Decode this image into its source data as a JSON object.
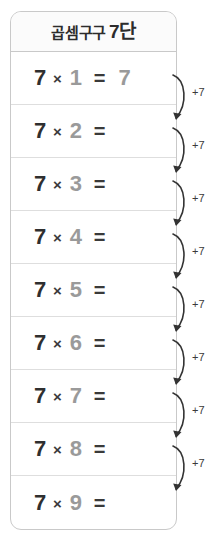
{
  "worksheet": {
    "title_prefix": "곱셈구구",
    "title_dan": "7단",
    "title_full": "곱셈구구 7단",
    "times_symbol": "×",
    "equals_symbol": "=",
    "multiplicand": "7",
    "step_label": "+7",
    "colors": {
      "card_border": "#c9c9c9",
      "row_divider": "#dedede",
      "header_bg": "#fbfbfb",
      "dark_text": "#2f2f2f",
      "gray_text": "#9a9a9a",
      "arrow": "#333333"
    },
    "rows": [
      {
        "left": "7",
        "times": "×",
        "right": "1",
        "equals": "=",
        "answer": "7"
      },
      {
        "left": "7",
        "times": "×",
        "right": "2",
        "equals": "=",
        "answer": ""
      },
      {
        "left": "7",
        "times": "×",
        "right": "3",
        "equals": "=",
        "answer": ""
      },
      {
        "left": "7",
        "times": "×",
        "right": "4",
        "equals": "=",
        "answer": ""
      },
      {
        "left": "7",
        "times": "×",
        "right": "5",
        "equals": "=",
        "answer": ""
      },
      {
        "left": "7",
        "times": "×",
        "right": "6",
        "equals": "=",
        "answer": ""
      },
      {
        "left": "7",
        "times": "×",
        "right": "7",
        "equals": "=",
        "answer": ""
      },
      {
        "left": "7",
        "times": "×",
        "right": "8",
        "equals": "=",
        "answer": ""
      },
      {
        "left": "7",
        "times": "×",
        "right": "9",
        "equals": "=",
        "answer": ""
      }
    ],
    "arrows": [
      {
        "label": "+7"
      },
      {
        "label": "+7"
      },
      {
        "label": "+7"
      },
      {
        "label": "+7"
      },
      {
        "label": "+7"
      },
      {
        "label": "+7"
      },
      {
        "label": "+7"
      },
      {
        "label": "+7"
      }
    ]
  }
}
